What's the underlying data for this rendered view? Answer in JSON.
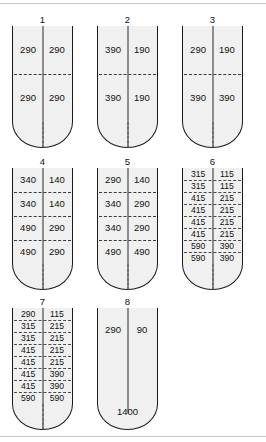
{
  "figure": {
    "shapes": [
      {
        "label": "1",
        "style": "standard",
        "rows": [
          [
            "290",
            "290"
          ],
          [
            "290",
            "290"
          ]
        ]
      },
      {
        "label": "2",
        "style": "standard",
        "rows": [
          [
            "390",
            "190"
          ],
          [
            "390",
            "190"
          ]
        ]
      },
      {
        "label": "3",
        "style": "standard",
        "rows": [
          [
            "290",
            "190"
          ],
          [
            "390",
            "390"
          ]
        ]
      },
      {
        "label": "4",
        "style": "standard",
        "rows": [
          [
            "340",
            "140"
          ],
          [
            "340",
            "140"
          ],
          [
            "490",
            "290"
          ],
          [
            "490",
            "290"
          ]
        ]
      },
      {
        "label": "5",
        "style": "standard",
        "rows": [
          [
            "290",
            "140"
          ],
          [
            "340",
            "290"
          ],
          [
            "340",
            "290"
          ],
          [
            "490",
            "490"
          ]
        ]
      },
      {
        "label": "6",
        "style": "dense",
        "rows": [
          [
            "315",
            "115"
          ],
          [
            "315",
            "115"
          ],
          [
            "415",
            "215"
          ],
          [
            "415",
            "215"
          ],
          [
            "415",
            "215"
          ],
          [
            "415",
            "215"
          ],
          [
            "590",
            "390"
          ],
          [
            "590",
            "390"
          ]
        ]
      },
      {
        "label": "7",
        "style": "dense",
        "rows": [
          [
            "290",
            "115"
          ],
          [
            "315",
            "215"
          ],
          [
            "315",
            "215"
          ],
          [
            "415",
            "215"
          ],
          [
            "415",
            "215"
          ],
          [
            "415",
            "390"
          ],
          [
            "415",
            "390"
          ],
          [
            "590",
            "590"
          ]
        ]
      },
      {
        "label": "8",
        "style": "standard",
        "rows": [
          [
            "290",
            "90"
          ]
        ],
        "bottom_value": "1400"
      }
    ]
  },
  "colors": {
    "vessel_fill": "#f0f0f0",
    "vessel_outline": "#1a1a1a",
    "divider": "#3a3a3a",
    "text": "#111111",
    "page_background": "#ffffff",
    "edge_rule": "#c9c9c9"
  }
}
